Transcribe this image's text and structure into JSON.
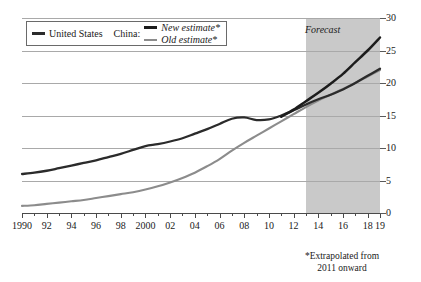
{
  "chart_data": {
    "type": "line",
    "title": "",
    "subtitle": "",
    "xlabel": "",
    "ylabel": "",
    "xlim": [
      1990,
      2019
    ],
    "ylim": [
      0,
      30
    ],
    "y_ticks": [
      0,
      5,
      10,
      15,
      20,
      25,
      30
    ],
    "y_tick_labels": [
      "0",
      "5",
      "10",
      "15",
      "20",
      "25",
      "30"
    ],
    "y_axis_position": "right",
    "grid": "horizontal",
    "legend_position": "top-left",
    "x_tick_labels": [
      "1990",
      "92",
      "94",
      "96",
      "98",
      "2000",
      "02",
      "04",
      "06",
      "08",
      "10",
      "12",
      "14",
      "16",
      "18",
      "19"
    ],
    "x_tick_years": [
      1990,
      1992,
      1994,
      1996,
      1998,
      2000,
      2002,
      2004,
      2006,
      2008,
      2010,
      2012,
      2014,
      2016,
      2018,
      2019
    ],
    "x_minor_tick_years": [
      1991,
      1993,
      1995,
      1997,
      1999,
      2001,
      2003,
      2005,
      2007,
      2009,
      2011,
      2013,
      2015,
      2017
    ],
    "annotations": [
      {
        "text": "Forecast",
        "type": "shaded-region-label",
        "start_year": 2013,
        "end_year": 2019
      }
    ],
    "footnote": [
      "*Extrapolated from",
      "2011 onward"
    ],
    "series": [
      {
        "name": "United States",
        "color": "#2b2b2b",
        "x": [
          1990,
          1991,
          1992,
          1993,
          1994,
          1995,
          1996,
          1997,
          1998,
          1999,
          2000,
          2001,
          2002,
          2003,
          2004,
          2005,
          2006,
          2007,
          2008,
          2009,
          2010,
          2011,
          2012,
          2013,
          2014,
          2015,
          2016,
          2017,
          2018,
          2019
        ],
        "values": [
          6.0,
          6.2,
          6.5,
          6.9,
          7.3,
          7.7,
          8.1,
          8.6,
          9.1,
          9.7,
          10.3,
          10.6,
          11.0,
          11.5,
          12.2,
          12.9,
          13.7,
          14.5,
          14.7,
          14.3,
          14.4,
          15.0,
          15.8,
          16.7,
          17.5,
          18.2,
          19.0,
          20.0,
          21.1,
          22.2
        ]
      },
      {
        "name": "China: New estimate*",
        "color": "#1c1c1c",
        "x": [
          2011,
          2012,
          2013,
          2014,
          2015,
          2016,
          2017,
          2018,
          2019
        ],
        "values": [
          14.8,
          15.9,
          17.2,
          18.5,
          19.9,
          21.4,
          23.2,
          25.0,
          27.0
        ]
      },
      {
        "name": "China: Old estimate*",
        "color": "#8c8c8c",
        "x": [
          1990,
          1991,
          1992,
          1993,
          1994,
          1995,
          1996,
          1997,
          1998,
          1999,
          2000,
          2001,
          2002,
          2003,
          2004,
          2005,
          2006,
          2007,
          2008,
          2009,
          2010,
          2011,
          2012,
          2013,
          2014,
          2015,
          2016,
          2017,
          2018,
          2019
        ],
        "values": [
          1.1,
          1.2,
          1.4,
          1.6,
          1.8,
          2.0,
          2.3,
          2.6,
          2.9,
          3.2,
          3.6,
          4.1,
          4.7,
          5.4,
          6.2,
          7.2,
          8.3,
          9.6,
          10.8,
          11.9,
          13.0,
          14.1,
          15.2,
          16.3,
          17.3,
          18.2,
          19.1,
          20.0,
          21.0,
          22.0
        ]
      }
    ]
  },
  "legend": {
    "us_label": "United States",
    "china_label": "China:",
    "new_estimate_label": "New estimate*",
    "old_estimate_label": "Old estimate*",
    "us_color": "#2b2b2b",
    "new_estimate_color": "#1c1c1c",
    "old_estimate_color": "#8c8c8c"
  },
  "forecast": {
    "label": "Forecast",
    "band_color": "#c9c9c9"
  },
  "footnote": {
    "line1": "*Extrapolated from",
    "line2": "2011 onward"
  }
}
